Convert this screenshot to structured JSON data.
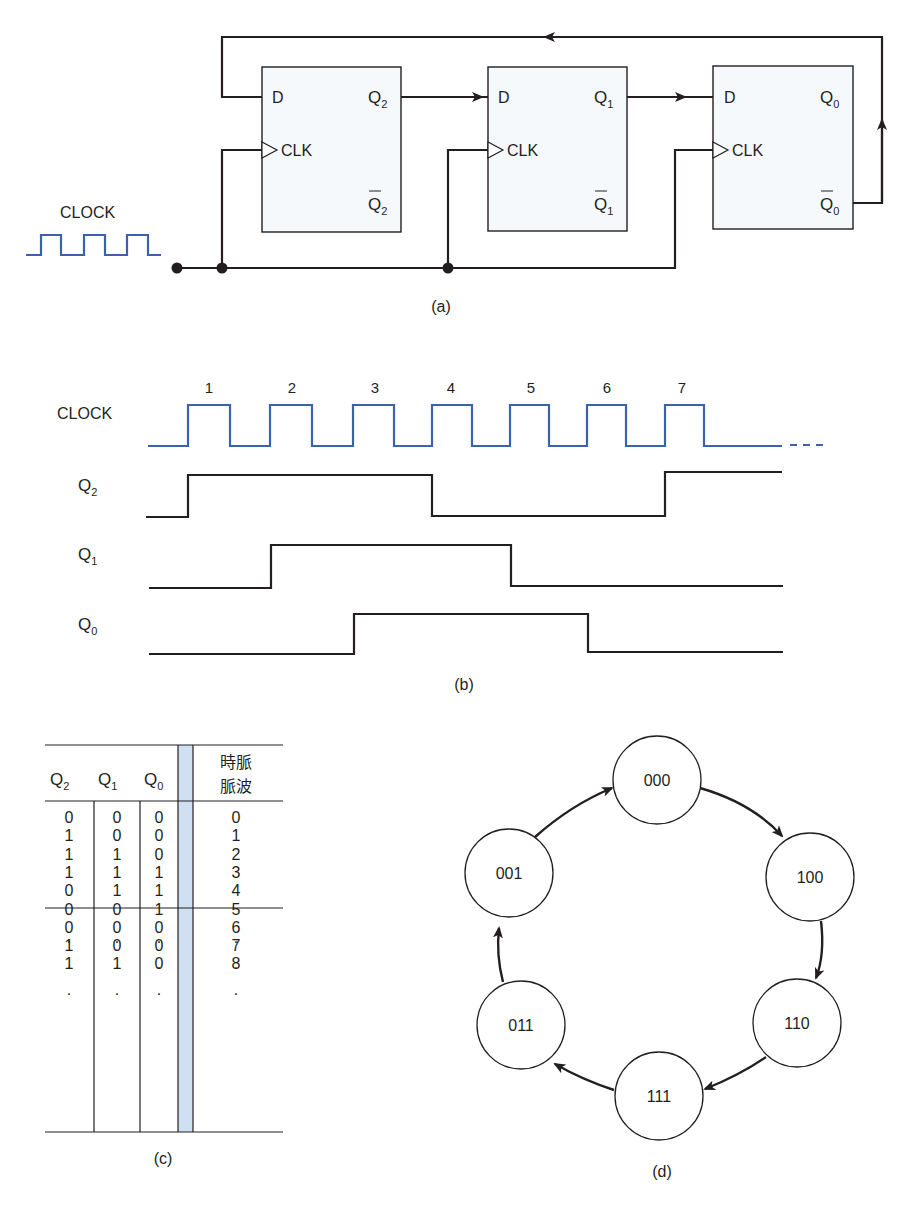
{
  "figure_a": {
    "caption": "(a)",
    "clock_label": "CLOCK",
    "flipflops": [
      {
        "id": "ff2",
        "d": "D",
        "clk": "CLK",
        "q": "Q",
        "q_sub": "2",
        "qbar": "Q",
        "qbar_sub": "2"
      },
      {
        "id": "ff1",
        "d": "D",
        "clk": "CLK",
        "q": "Q",
        "q_sub": "1",
        "qbar": "Q",
        "qbar_sub": "1"
      },
      {
        "id": "ff0",
        "d": "D",
        "clk": "CLK",
        "q": "Q",
        "q_sub": "0",
        "qbar": "Q",
        "qbar_sub": "0"
      }
    ]
  },
  "figure_b": {
    "caption": "(b)",
    "pulse_numbers": [
      "1",
      "2",
      "3",
      "4",
      "5",
      "6",
      "7"
    ],
    "signals": [
      {
        "name": "CLOCK",
        "sub": ""
      },
      {
        "name": "Q",
        "sub": "2"
      },
      {
        "name": "Q",
        "sub": "1"
      },
      {
        "name": "Q",
        "sub": "0"
      }
    ]
  },
  "figure_c": {
    "caption": "(c)",
    "headers": [
      {
        "name": "Q",
        "sub": "2"
      },
      {
        "name": "Q",
        "sub": "1"
      },
      {
        "name": "Q",
        "sub": "0"
      }
    ],
    "pulse_header_line1": "時脈",
    "pulse_header_line2": "脈波",
    "rows": [
      [
        "0",
        "0",
        "0",
        "0"
      ],
      [
        "1",
        "0",
        "0",
        "1"
      ],
      [
        "1",
        "1",
        "0",
        "2"
      ],
      [
        "1",
        "1",
        "1",
        "3"
      ],
      [
        "0",
        "1",
        "1",
        "4"
      ],
      [
        "0",
        "0",
        "1",
        "5"
      ],
      [
        "0",
        "0",
        "0",
        "6"
      ],
      [
        "1",
        "0",
        "0",
        "7"
      ],
      [
        "1",
        "1",
        "0",
        "8"
      ],
      [
        ".",
        ".",
        ".",
        "."
      ],
      [
        ".",
        ".",
        ".",
        "."
      ],
      [
        ".",
        ".",
        ".",
        "."
      ]
    ]
  },
  "figure_d": {
    "caption": "(d)",
    "states": [
      "000",
      "100",
      "110",
      "111",
      "011",
      "001"
    ]
  },
  "colors": {
    "clock_blue": "#3b63ad",
    "line_dark": "#231f20",
    "band_blue": "#cfe0f2",
    "box_fill": "#f6f9fb"
  },
  "chart_data": {
    "type": "timing",
    "x": [
      "0",
      "1",
      "2",
      "3",
      "4",
      "5",
      "6",
      "7"
    ],
    "series": [
      {
        "name": "Q2",
        "values": [
          0,
          1,
          1,
          1,
          0,
          0,
          0,
          1
        ]
      },
      {
        "name": "Q1",
        "values": [
          0,
          0,
          1,
          1,
          1,
          0,
          0,
          0
        ]
      },
      {
        "name": "Q0",
        "values": [
          0,
          0,
          0,
          1,
          1,
          1,
          0,
          0
        ]
      }
    ],
    "clock_pulses": 7
  }
}
